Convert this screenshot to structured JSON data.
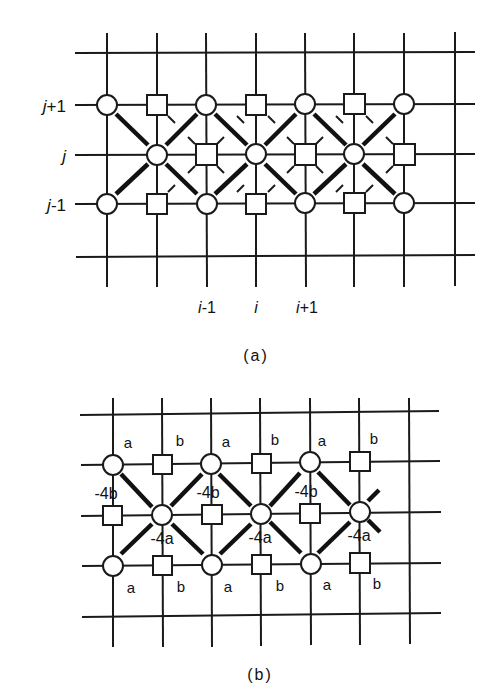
{
  "figure_a": {
    "caption": "(a)",
    "row_labels": [
      {
        "var": "j",
        "suffix": "+1"
      },
      {
        "var": "j",
        "suffix": ""
      },
      {
        "var": "j",
        "suffix": "-1"
      }
    ],
    "col_labels": [
      {
        "var": "i",
        "suffix": "-1"
      },
      {
        "var": "i",
        "suffix": ""
      },
      {
        "var": "i",
        "suffix": "+1"
      }
    ],
    "legend": {
      "circle": "circle-node",
      "square": "square-node"
    }
  },
  "figure_b": {
    "caption": "(b)",
    "top_labels": [
      "a",
      "b",
      "a",
      "b",
      "a",
      "b"
    ],
    "bottom_labels": [
      "a",
      "b",
      "a",
      "b",
      "a",
      "b"
    ],
    "middle_b_labels": [
      "-4b",
      "-4b",
      "-4b"
    ],
    "middle_a_labels": [
      "-4a",
      "-4a",
      "-4a"
    ]
  }
}
